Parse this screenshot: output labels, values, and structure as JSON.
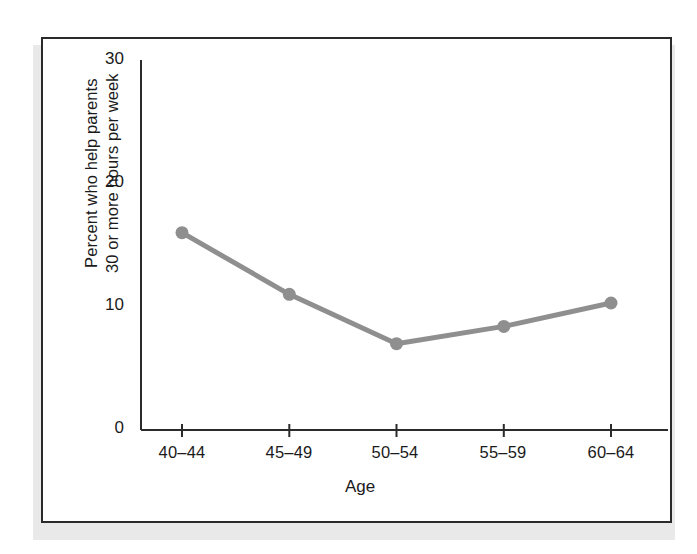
{
  "figure": {
    "frame_color": "#2a2a2a",
    "background": "#ffffff",
    "shadow_color": "#e9e9e9"
  },
  "chart_data": {
    "type": "line",
    "title": "",
    "subtitle": "",
    "xlabel": "Age",
    "ylabel": "Percent who help parents 30 or more hours per week",
    "ylabel_lines": [
      "Percent who help parents",
      "30 or more hours per week"
    ],
    "categories": [
      "40–44",
      "45–49",
      "50–54",
      "55–59",
      "60–64"
    ],
    "values": [
      16,
      11,
      7,
      8.4,
      10.3
    ],
    "ylim": [
      0,
      30
    ],
    "yticks": [
      0,
      10,
      20,
      30
    ],
    "ytick_labels": [
      "0",
      "10",
      "20",
      "30"
    ],
    "grid": false,
    "legend": false,
    "legend_position": "none",
    "series": [
      {
        "name": "Percent who help parents 30 or more hours per week",
        "values": [
          16,
          11,
          7,
          8.4,
          10.3
        ],
        "color": "#8f8f8f",
        "marker": "circle",
        "line_width": 5
      }
    ],
    "annotations": []
  },
  "axes": {
    "axis_color": "#2b2b2b",
    "tick_length": 8
  }
}
